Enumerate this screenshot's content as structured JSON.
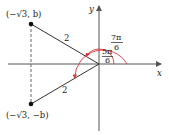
{
  "diagram": {
    "axes": {
      "x_label": "x",
      "y_label": "y",
      "origin_px": [
        99,
        64
      ]
    },
    "points": [
      {
        "label": "(−√3, b)",
        "px": [
          31,
          24
        ]
      },
      {
        "label": "(−√3, −b)",
        "px": [
          31,
          104
        ]
      }
    ],
    "segments": [
      {
        "label": "2",
        "from": "origin",
        "to": "(−√3, b)"
      },
      {
        "label": "2",
        "from": "origin",
        "to": "(−√3, −b)"
      }
    ],
    "angles": [
      {
        "numerator": "7π",
        "denominator": "6",
        "color": "#d9363e",
        "kind": "outer-arc"
      },
      {
        "numerator": "5π",
        "denominator": "6",
        "color": "#d9363e",
        "kind": "inner-arc"
      }
    ],
    "colors": {
      "axis": "#555555",
      "line": "#333333",
      "arc": "#d9363e",
      "dash": "#666666"
    }
  }
}
